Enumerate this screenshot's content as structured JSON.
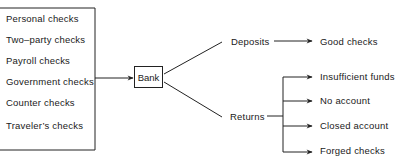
{
  "sources": {
    "items": [
      {
        "label": "Personal checks"
      },
      {
        "label": "Two–party checks"
      },
      {
        "label": "Payroll checks"
      },
      {
        "label": "Government checks"
      },
      {
        "label": "Counter checks"
      },
      {
        "label": "Traveler’s checks"
      }
    ]
  },
  "center": {
    "label": "Bank"
  },
  "branches": {
    "deposits": {
      "label": "Deposits",
      "outcome": "Good checks"
    },
    "returns": {
      "label": "Returns",
      "outcomes": [
        {
          "label": "Insufficient funds"
        },
        {
          "label": "No account"
        },
        {
          "label": "Closed account"
        },
        {
          "label": "Forged checks"
        }
      ]
    }
  },
  "colors": {
    "line": "#222222",
    "text": "#1a1a1a",
    "background": "#ffffff"
  }
}
